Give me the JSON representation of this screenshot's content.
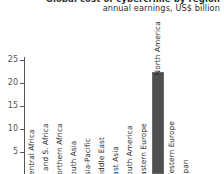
{
  "header": {
    "title": "Global cost of cybercrime by region",
    "subtitle": "annual earnings, US$ billion"
  },
  "chart_data": {
    "type": "bar",
    "title": "Global cost of cybercrime by region",
    "subtitle": "annual earnings, US$ billion",
    "xlabel": "",
    "ylabel": "annual earnings, US$ billion",
    "ylim": [
      0,
      26
    ],
    "yticks": [
      5,
      10,
      15,
      20,
      25
    ],
    "ytick_labels": [
      "5",
      "10",
      "15",
      "20",
      "25"
    ],
    "grid": false,
    "legend": null,
    "categories": [
      "Central Africa",
      "E. and S. Africa",
      "Northern Africa",
      "South Asia",
      "Asia-Pacific",
      "Middle East",
      "East Asia",
      "South America",
      "Eastern Europe",
      "North America",
      "Western Europe",
      "Japan"
    ],
    "values": [
      0,
      0,
      0,
      0,
      0,
      0,
      0,
      0,
      0,
      22.2,
      0,
      0
    ],
    "bar_color": "#4f4f4f",
    "axis_color": "#555555"
  }
}
